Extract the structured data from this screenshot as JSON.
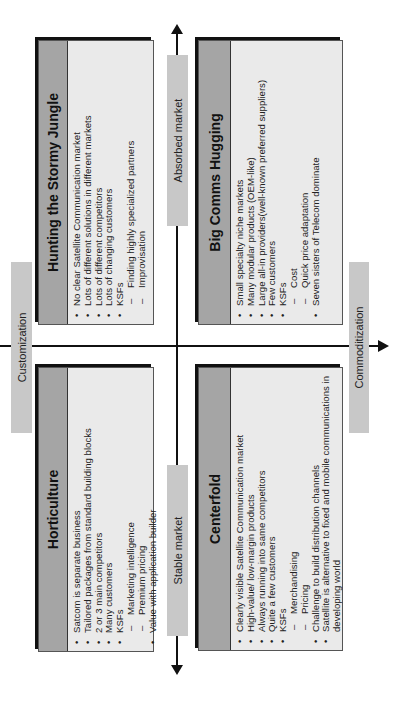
{
  "axes": {
    "horizontal": {
      "left_label": "Stable market",
      "right_label": "Absorbed market"
    },
    "vertical": {
      "top_label": "Customization",
      "bottom_label": "Commoditization"
    }
  },
  "quadrants": {
    "top_left": {
      "title": "Horticulture",
      "items": [
        {
          "type": "bullet",
          "text": "Satcom is separate business"
        },
        {
          "type": "bullet",
          "text": "Tailored packages from standard building blocks"
        },
        {
          "type": "bullet",
          "text": "2 or 3 main competitors"
        },
        {
          "type": "bullet",
          "text": "Many customers"
        },
        {
          "type": "bullet",
          "text": "KSFs"
        },
        {
          "type": "sub",
          "text": "Marketing intelligence"
        },
        {
          "type": "sub",
          "text": "Premium pricing"
        },
        {
          "type": "bullet",
          "text": "Value with application builder"
        }
      ]
    },
    "top_right": {
      "title": "Hunting the Stormy Jungle",
      "items": [
        {
          "type": "bullet",
          "text": "No clear Satellite Communication market"
        },
        {
          "type": "bullet",
          "text": "Lots of different solutions in different markets"
        },
        {
          "type": "bullet",
          "text": "Lots of different competitors"
        },
        {
          "type": "bullet",
          "text": "Lots of changing customers"
        },
        {
          "type": "bullet",
          "text": "KSFs"
        },
        {
          "type": "sub",
          "text": "Finding highly specialized partners"
        },
        {
          "type": "sub",
          "text": "Improvisation"
        }
      ]
    },
    "bottom_left": {
      "title": "Centerfold",
      "items": [
        {
          "type": "bullet",
          "text": "Clearly visible Satellite Communication market"
        },
        {
          "type": "bullet",
          "text": "High-value/ low-margin products"
        },
        {
          "type": "bullet",
          "text": "Always running into same competitors"
        },
        {
          "type": "bullet",
          "text": "Quite a few customers"
        },
        {
          "type": "bullet",
          "text": "KSFs"
        },
        {
          "type": "sub",
          "text": "Merchandising"
        },
        {
          "type": "sub",
          "text": "Pricing"
        },
        {
          "type": "bullet",
          "text": "Challenge to build distribution channels"
        },
        {
          "type": "bullet",
          "text": "Satellite is alternative to fixed and mobile communications in developing world"
        }
      ]
    },
    "bottom_right": {
      "title": "Big Comms Hugging",
      "items": [
        {
          "type": "bullet",
          "text": "Small specialty niche markets"
        },
        {
          "type": "bullet",
          "text": "Many modular products (OEM-like)"
        },
        {
          "type": "bullet",
          "text": "Large all-in providers(well-known preferred suppliers)"
        },
        {
          "type": "bullet",
          "text": "Few customers"
        },
        {
          "type": "bullet",
          "text": "KSFs"
        },
        {
          "type": "sub",
          "text": "Cost"
        },
        {
          "type": "sub",
          "text": "Quick price adaptation"
        },
        {
          "type": "bullet",
          "text": "Seven sisters of Telecom dominate"
        }
      ]
    }
  },
  "colors": {
    "label_bg": "#c8c8c8",
    "header_bg": "#a5a5a5",
    "body_bg": "#eaeaea",
    "line": "#111111"
  }
}
